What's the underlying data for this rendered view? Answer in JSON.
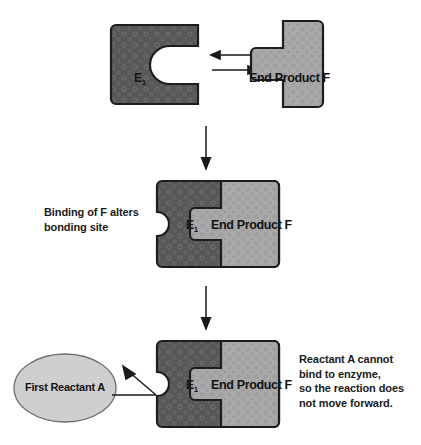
{
  "diagram": {
    "colors": {
      "enzyme_fill": "#585858",
      "enzyme_pattern": "#6e6e6e",
      "product_fill": "#a8a8a8",
      "product_pattern": "#bdbdbd",
      "reactant_fill": "#cfcfcf",
      "outline": "#1d1d1d",
      "arrow": "#1a1a1a",
      "background": "#ffffff",
      "text": "#1a1a1a"
    }
  },
  "stage1": {
    "name": "Unbound enzyme and end product",
    "enzyme_label": "E",
    "enzyme_subscript": "1",
    "product_label": "End Product F",
    "arrow_left": "reversible-arrow-left",
    "arrow_right": "reversible-arrow-right"
  },
  "stage2": {
    "name": "End product bound to enzyme",
    "enzyme_label": "E",
    "enzyme_subscript": "1",
    "product_label": "End Product F",
    "caption": "Binding of F alters\nbonding site"
  },
  "stage3": {
    "name": "Reactant A cannot bind",
    "enzyme_label": "E",
    "enzyme_subscript": "1",
    "product_label": "End Product F",
    "reactant_label": "First Reactant A",
    "caption": "Reactant A cannot\nbind to enzyme,\nso the reaction does\nnot move forward."
  },
  "flow": {
    "arrow1": "down-arrow",
    "arrow2": "down-arrow",
    "arrow3": "blocked-binding-arrow"
  }
}
